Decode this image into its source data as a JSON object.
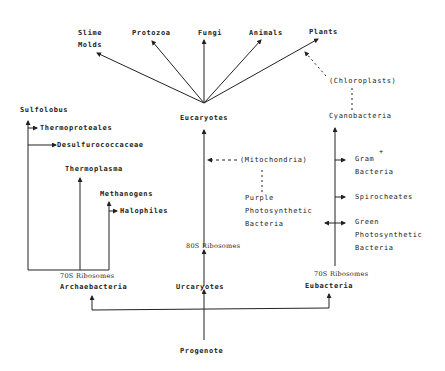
{
  "diagram": {
    "type": "phylogenetic-tree",
    "colors": {
      "line": "#222222",
      "text": "#222222",
      "background": "#ffffff"
    },
    "eukaryote_branches": {
      "slime_molds_1": "Slime",
      "slime_molds_2": "Molds",
      "protozoa": "Protozoa",
      "fungi": "Fungi",
      "animals": "Animals",
      "plants": "Plants"
    },
    "organelles": {
      "chloroplasts": "(Chloroplasts)",
      "mitochondria": "(Mitochondria)"
    },
    "nodes": {
      "eucaryotes": "Eucaryotes",
      "cyanobacteria": "Cyanobacteria",
      "urcaryotes": "Urcaryotes",
      "archaebacteria": "Archaebacteria",
      "eubacteria": "Eubacteria",
      "progenote": "Progenote"
    },
    "ribosomes": {
      "archae": "70S Ribosomes",
      "urcaryote": "80S Ribosomes",
      "eubacteria": "70S Ribosomes"
    },
    "archaebacteria_branches": {
      "sulfolobus": "Sulfolobus",
      "thermoproteales": "Thermoproteales",
      "desulfurococcaceae": "Desulfurococcaceae",
      "thermoplasma": "Thermoplasma",
      "methanogens": "Methanogens",
      "halophiles": "Halophiles"
    },
    "eubacteria_branches": {
      "gram_1": "Gram",
      "gram_sup": "+",
      "gram_2": "Bacteria",
      "spirocheates": "Spirocheates",
      "green_1": "Green",
      "green_2": "Photosynthetic",
      "green_3": "Bacteria",
      "purple_1": "Purple",
      "purple_2": "Photosynthetic",
      "purple_3": "Bacteria"
    }
  }
}
